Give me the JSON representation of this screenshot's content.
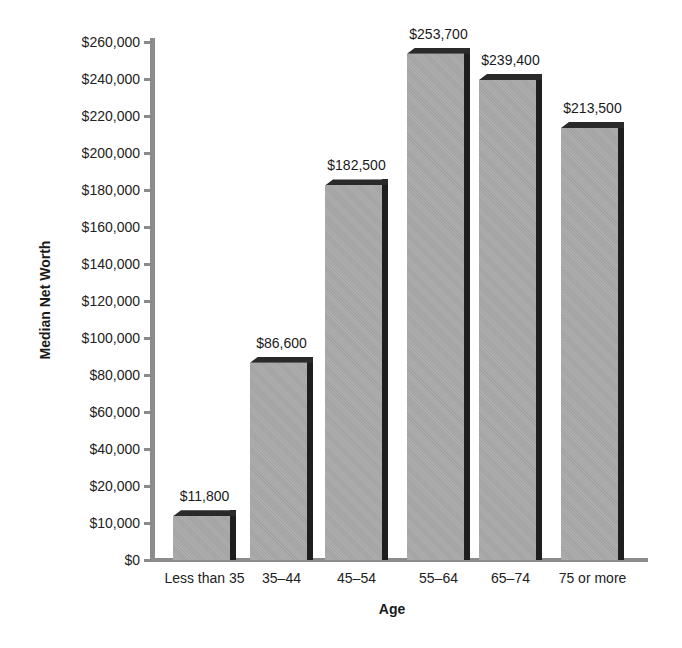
{
  "chart_data": {
    "type": "bar",
    "title": "",
    "xlabel": "Age",
    "ylabel": "Median Net Worth",
    "categories": [
      "Less than 35",
      "35–44",
      "45–54",
      "55–64",
      "65–74",
      "75 or more"
    ],
    "values": [
      11800,
      86600,
      182500,
      253700,
      239400,
      213500
    ],
    "value_labels": [
      "$11,800",
      "$86,600",
      "$182,500",
      "$253,700",
      "$239,400",
      "$213,500"
    ],
    "y_ticks": [
      "$0",
      "$10,000",
      "$20,000",
      "$40,000",
      "$60,000",
      "$80,000",
      "$100,000",
      "$120,000",
      "$140,000",
      "$160,000",
      "$180,000",
      "$200,000",
      "$220,000",
      "$240,000",
      "$260,000"
    ],
    "ylim": [
      0,
      260000
    ],
    "grid": false,
    "legend": null,
    "style": "3d-shaded bars",
    "colors": {
      "bar_face": "#a9a9a9",
      "bar_side": "#1e1e1e",
      "axis": "#8c8c8c"
    }
  }
}
